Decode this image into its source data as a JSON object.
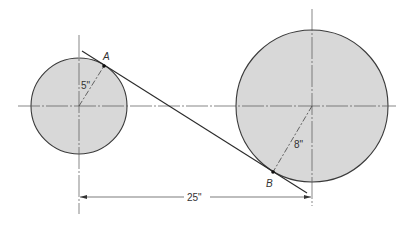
{
  "diagram": {
    "colors": {
      "circle_fill": "#d8d8d8",
      "stroke": "#3a3a3a",
      "background": "#ffffff"
    },
    "small_circle": {
      "radius_label": "5\"",
      "radius_value_in": 5
    },
    "large_circle": {
      "radius_label": "8\"",
      "radius_value_in": 8
    },
    "center_distance": {
      "label": "25\"",
      "value_in": 25
    },
    "tangent_points": [
      {
        "label": "A",
        "on": "small_circle"
      },
      {
        "label": "B",
        "on": "large_circle"
      }
    ]
  }
}
